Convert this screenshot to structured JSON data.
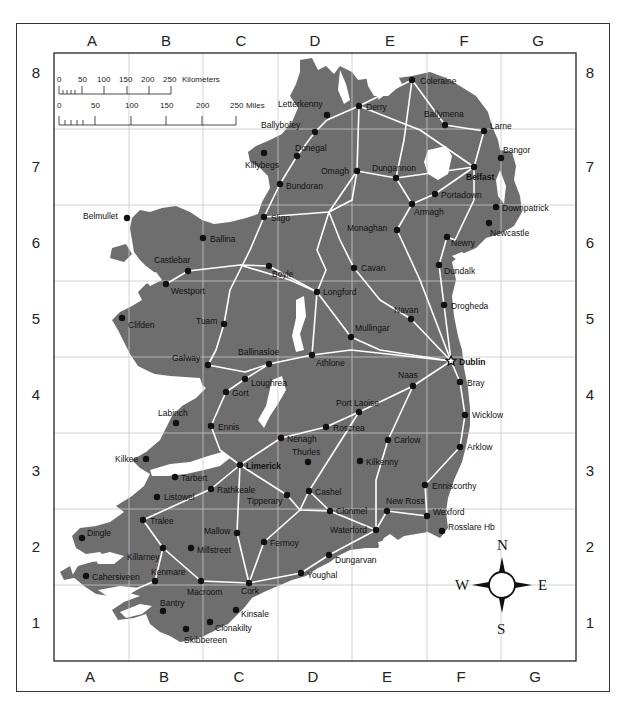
{
  "map": {
    "columns": [
      "A",
      "B",
      "C",
      "D",
      "E",
      "F",
      "G"
    ],
    "rows": [
      "8",
      "7",
      "6",
      "5",
      "4",
      "3",
      "2",
      "1"
    ],
    "colors": {
      "land": "#6e6e6e",
      "water": "#ffffff",
      "road": "#ffffff",
      "grid": "#c8c8c8",
      "frame": "#333333",
      "city": "#111111"
    },
    "scale_bar": {
      "km": {
        "ticks": [
          "0",
          "50",
          "100",
          "150",
          "200",
          "250"
        ],
        "unit": "Kilometers"
      },
      "miles": {
        "ticks": [
          "0",
          "50",
          "100",
          "150",
          "200",
          "250"
        ],
        "unit": "Miles"
      }
    },
    "compass": {
      "n": "N",
      "s": "S",
      "e": "E",
      "w": "W"
    },
    "cities": [
      {
        "name": "Coleraine",
        "x": 412,
        "y": 80,
        "lx": 420,
        "ly": 84
      },
      {
        "name": "Derry",
        "x": 359,
        "y": 106,
        "lx": 366,
        "ly": 110
      },
      {
        "name": "Letterkenny",
        "x": 327,
        "y": 115,
        "lx": 278,
        "ly": 107
      },
      {
        "name": "Ballymena",
        "x": 445,
        "y": 125,
        "lx": 424,
        "ly": 117
      },
      {
        "name": "Larne",
        "x": 484,
        "y": 131,
        "lx": 490,
        "ly": 129
      },
      {
        "name": "Ballybofey",
        "x": 315,
        "y": 132,
        "lx": 261,
        "ly": 128
      },
      {
        "name": "Donegal",
        "x": 297,
        "y": 156,
        "lx": 295,
        "ly": 151
      },
      {
        "name": "Killybegs",
        "x": 264,
        "y": 153,
        "lx": 245,
        "ly": 168
      },
      {
        "name": "Bangor",
        "x": 501,
        "y": 158,
        "lx": 503,
        "ly": 153
      },
      {
        "name": "Omagh",
        "x": 357,
        "y": 171,
        "lx": 321,
        "ly": 174
      },
      {
        "name": "Dungannon",
        "x": 396,
        "y": 178,
        "lx": 372,
        "ly": 171
      },
      {
        "name": "Belfast",
        "x": 474,
        "y": 167,
        "lx": 466,
        "ly": 180,
        "bold": true
      },
      {
        "name": "Bundoran",
        "x": 280,
        "y": 184,
        "lx": 286,
        "ly": 189
      },
      {
        "name": "Portadown",
        "x": 435,
        "y": 194,
        "lx": 441,
        "ly": 198
      },
      {
        "name": "Armagh",
        "x": 412,
        "y": 204,
        "lx": 414,
        "ly": 215
      },
      {
        "name": "Downpatrick",
        "x": 496,
        "y": 207,
        "lx": 502,
        "ly": 211
      },
      {
        "name": "Sligo",
        "x": 264,
        "y": 217,
        "lx": 271,
        "ly": 221
      },
      {
        "name": "Newcastle",
        "x": 489,
        "y": 223,
        "lx": 490,
        "ly": 236
      },
      {
        "name": "Monaghan",
        "x": 397,
        "y": 230,
        "lx": 347,
        "ly": 231
      },
      {
        "name": "Belmullet",
        "x": 127,
        "y": 218,
        "lx": 83,
        "ly": 219
      },
      {
        "name": "Ballina",
        "x": 203,
        "y": 238,
        "lx": 210,
        "ly": 242
      },
      {
        "name": "Newry",
        "x": 447,
        "y": 237,
        "lx": 451,
        "ly": 246
      },
      {
        "name": "Dundalk",
        "x": 439,
        "y": 265,
        "lx": 444,
        "ly": 274
      },
      {
        "name": "Castlebar",
        "x": 188,
        "y": 271,
        "lx": 154,
        "ly": 263
      },
      {
        "name": "Boyle",
        "x": 269,
        "y": 266,
        "lx": 272,
        "ly": 277
      },
      {
        "name": "Cavan",
        "x": 354,
        "y": 268,
        "lx": 361,
        "ly": 271
      },
      {
        "name": "Westport",
        "x": 166,
        "y": 284,
        "lx": 171,
        "ly": 294
      },
      {
        "name": "Longford",
        "x": 317,
        "y": 292,
        "lx": 323,
        "ly": 295
      },
      {
        "name": "Drogheda",
        "x": 444,
        "y": 305,
        "lx": 451,
        "ly": 309
      },
      {
        "name": "Clifden",
        "x": 122,
        "y": 318,
        "lx": 128,
        "ly": 328
      },
      {
        "name": "Tuam",
        "x": 224,
        "y": 324,
        "lx": 196,
        "ly": 324
      },
      {
        "name": "Navan",
        "x": 411,
        "y": 319,
        "lx": 394,
        "ly": 313
      },
      {
        "name": "Mullingar",
        "x": 351,
        "y": 337,
        "lx": 355,
        "ly": 331
      },
      {
        "name": "Dublin",
        "x": 451,
        "y": 361,
        "lx": 459,
        "ly": 365,
        "bold": true,
        "capital": true
      },
      {
        "name": "Ballinasloe",
        "x": 269,
        "y": 364,
        "lx": 238,
        "ly": 355
      },
      {
        "name": "Athlone",
        "x": 312,
        "y": 355,
        "lx": 316,
        "ly": 366
      },
      {
        "name": "Galway",
        "x": 208,
        "y": 365,
        "lx": 172,
        "ly": 361
      },
      {
        "name": "Loughrea",
        "x": 245,
        "y": 379,
        "lx": 251,
        "ly": 386
      },
      {
        "name": "Bray",
        "x": 460,
        "y": 382,
        "lx": 467,
        "ly": 386
      },
      {
        "name": "Naas",
        "x": 413,
        "y": 386,
        "lx": 398,
        "ly": 378
      },
      {
        "name": "Gort",
        "x": 226,
        "y": 392,
        "lx": 232,
        "ly": 396
      },
      {
        "name": "Port Laoise",
        "x": 359,
        "y": 412,
        "lx": 336,
        "ly": 406
      },
      {
        "name": "Wicklow",
        "x": 465,
        "y": 415,
        "lx": 472,
        "ly": 418
      },
      {
        "name": "Labinch",
        "x": 176,
        "y": 423,
        "lx": 158,
        "ly": 416
      },
      {
        "name": "Roscrea",
        "x": 326,
        "y": 427,
        "lx": 333,
        "ly": 431
      },
      {
        "name": "Ennis",
        "x": 211,
        "y": 426,
        "lx": 218,
        "ly": 430
      },
      {
        "name": "Nenagh",
        "x": 281,
        "y": 438,
        "lx": 287,
        "ly": 442
      },
      {
        "name": "Carlow",
        "x": 388,
        "y": 440,
        "lx": 394,
        "ly": 443
      },
      {
        "name": "Arklow",
        "x": 460,
        "y": 447,
        "lx": 467,
        "ly": 450
      },
      {
        "name": "Thurles",
        "x": 308,
        "y": 462,
        "lx": 292,
        "ly": 455
      },
      {
        "name": "Kilkee",
        "x": 146,
        "y": 459,
        "lx": 115,
        "ly": 462
      },
      {
        "name": "Kilkenny",
        "x": 360,
        "y": 461,
        "lx": 366,
        "ly": 465
      },
      {
        "name": "Limerick",
        "x": 240,
        "y": 465,
        "lx": 246,
        "ly": 469,
        "bold": true
      },
      {
        "name": "Tarbert",
        "x": 175,
        "y": 477,
        "lx": 181,
        "ly": 481
      },
      {
        "name": "Enniscorthy",
        "x": 425,
        "y": 485,
        "lx": 432,
        "ly": 489
      },
      {
        "name": "Rathkeale",
        "x": 211,
        "y": 489,
        "lx": 217,
        "ly": 493
      },
      {
        "name": "Cashel",
        "x": 309,
        "y": 491,
        "lx": 315,
        "ly": 495
      },
      {
        "name": "Tipperary",
        "x": 287,
        "y": 495,
        "lx": 247,
        "ly": 504
      },
      {
        "name": "Listowel",
        "x": 157,
        "y": 497,
        "lx": 164,
        "ly": 500
      },
      {
        "name": "Clonmel",
        "x": 330,
        "y": 511,
        "lx": 336,
        "ly": 514
      },
      {
        "name": "New Ross",
        "x": 387,
        "y": 511,
        "lx": 386,
        "ly": 504
      },
      {
        "name": "Wexford",
        "x": 427,
        "y": 516,
        "lx": 433,
        "ly": 515
      },
      {
        "name": "Tralee",
        "x": 143,
        "y": 520,
        "lx": 150,
        "ly": 524
      },
      {
        "name": "Rosslare Hb",
        "x": 442,
        "y": 531,
        "lx": 448,
        "ly": 530
      },
      {
        "name": "Waterford",
        "x": 376,
        "y": 530,
        "lx": 330,
        "ly": 533
      },
      {
        "name": "Mallow",
        "x": 237,
        "y": 533,
        "lx": 204,
        "ly": 534
      },
      {
        "name": "Dingle",
        "x": 82,
        "y": 538,
        "lx": 87,
        "ly": 536
      },
      {
        "name": "Fermoy",
        "x": 264,
        "y": 542,
        "lx": 270,
        "ly": 546
      },
      {
        "name": "Killarney",
        "x": 163,
        "y": 548,
        "lx": 127,
        "ly": 560
      },
      {
        "name": "Millstreet",
        "x": 191,
        "y": 548,
        "lx": 197,
        "ly": 553
      },
      {
        "name": "Dungarvan",
        "x": 329,
        "y": 555,
        "lx": 335,
        "ly": 563
      },
      {
        "name": "Cahersiveen",
        "x": 86,
        "y": 576,
        "lx": 92,
        "ly": 580
      },
      {
        "name": "Kenmare",
        "x": 155,
        "y": 581,
        "lx": 151,
        "ly": 575
      },
      {
        "name": "Youghal",
        "x": 301,
        "y": 573,
        "lx": 307,
        "ly": 578
      },
      {
        "name": "Macroom",
        "x": 201,
        "y": 581,
        "lx": 187,
        "ly": 595
      },
      {
        "name": "Cork",
        "x": 249,
        "y": 583,
        "lx": 241,
        "ly": 594
      },
      {
        "name": "Bantry",
        "x": 163,
        "y": 611,
        "lx": 160,
        "ly": 606
      },
      {
        "name": "Kinsale",
        "x": 236,
        "y": 610,
        "lx": 241,
        "ly": 617
      },
      {
        "name": "Clonakilty",
        "x": 210,
        "y": 622,
        "lx": 215,
        "ly": 631
      },
      {
        "name": "Skibbereen",
        "x": 186,
        "y": 629,
        "lx": 184,
        "ly": 643
      }
    ]
  }
}
